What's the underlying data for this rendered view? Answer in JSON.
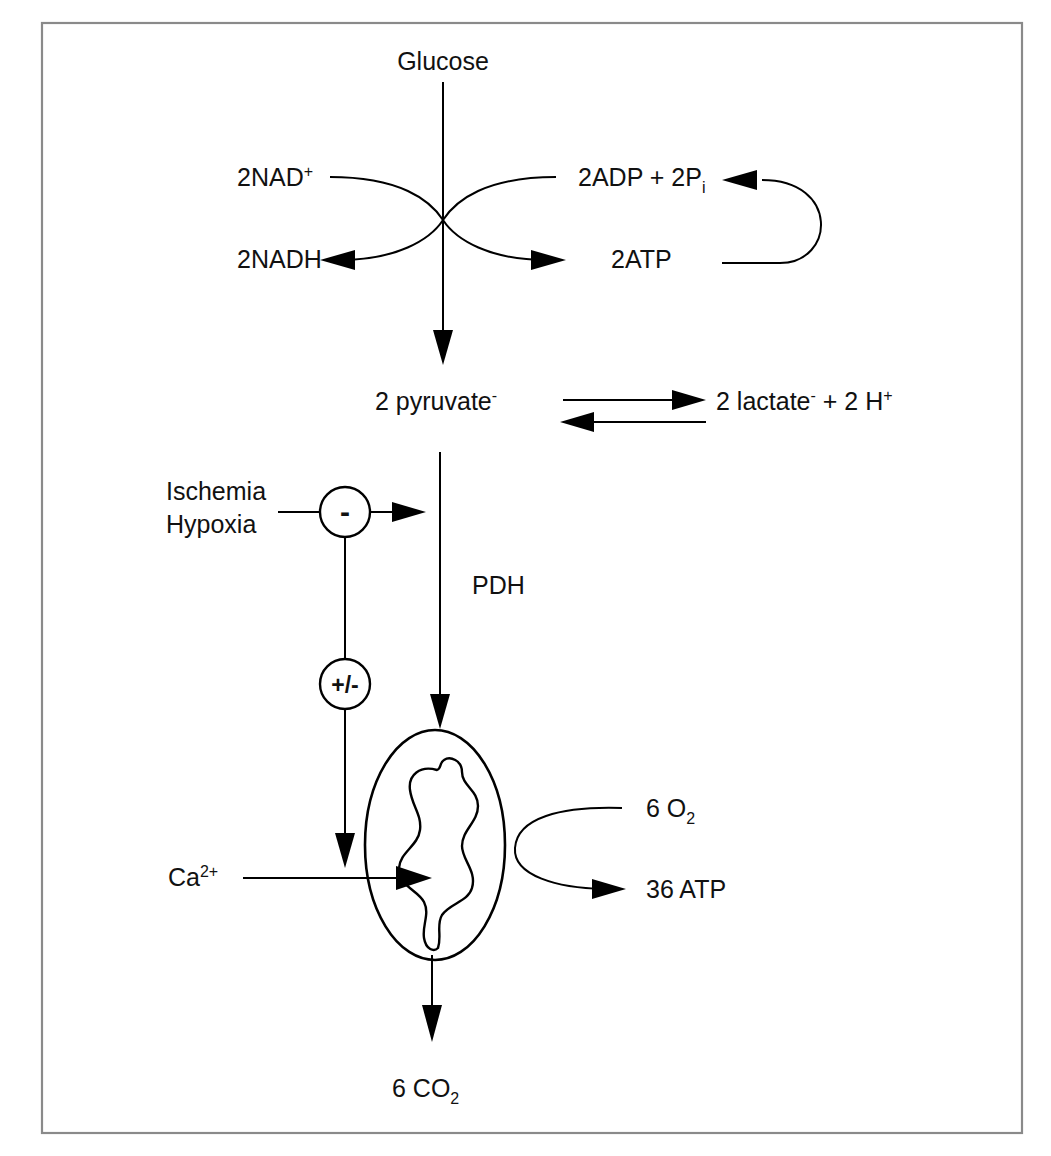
{
  "figure": {
    "border_color": "#8a8a8a",
    "line_color": "#000000",
    "background": "#ffffff"
  },
  "labels": {
    "glucose": "Glucose",
    "nad_plus": "2NAD",
    "nad_plus_sup": "+",
    "nadh": "2NADH",
    "adp": "2ADP + 2P",
    "adp_sub": "i",
    "atp": "2ATP",
    "pyruvate": "2 pyruvate",
    "pyruvate_sup": "-",
    "lactate": "2 lactate",
    "lactate_sup": "-",
    "lactate_tail": " + 2 H",
    "lactate_tail_sup": "+",
    "ischemia": "Ischemia",
    "hypoxia": "Hypoxia",
    "pdh": "PDH",
    "calcium": "Ca",
    "calcium_sup": "2+",
    "oxygen": "6 O",
    "oxygen_sub": "2",
    "atp36": "36 ATP",
    "co2": "6 CO",
    "co2_sub": "2"
  },
  "nodes": {
    "inhibition_symbol": "-",
    "modulation_symbol": "+/-"
  },
  "organelle": {
    "name": "mitochondrion"
  }
}
